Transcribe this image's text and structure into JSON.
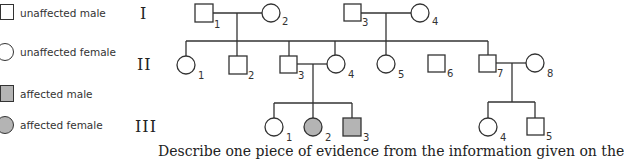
{
  "legend": {
    "items": [
      {
        "label": "unaffected male",
        "shape": "square",
        "affected": false
      },
      {
        "label": "unaffected female",
        "shape": "circle",
        "affected": false
      },
      {
        "label": "affected male",
        "shape": "square",
        "affected": true
      },
      {
        "label": "affected female",
        "shape": "circle",
        "affected": true
      }
    ]
  },
  "generations": [
    "I",
    "II",
    "III"
  ],
  "individuals": {
    "I": [
      {
        "id": "1",
        "sex": "male",
        "affected": false
      },
      {
        "id": "2",
        "sex": "female",
        "affected": false
      },
      {
        "id": "3",
        "sex": "male",
        "affected": false
      },
      {
        "id": "4",
        "sex": "female",
        "affected": false
      }
    ],
    "II": [
      {
        "id": "1",
        "sex": "female",
        "affected": false
      },
      {
        "id": "2",
        "sex": "male",
        "affected": false
      },
      {
        "id": "3",
        "sex": "male",
        "affected": false
      },
      {
        "id": "4",
        "sex": "female",
        "affected": false
      },
      {
        "id": "5",
        "sex": "female",
        "affected": false
      },
      {
        "id": "6",
        "sex": "male",
        "affected": false
      },
      {
        "id": "7",
        "sex": "male",
        "affected": false
      },
      {
        "id": "8",
        "sex": "female",
        "affected": false
      }
    ],
    "III": [
      {
        "id": "1",
        "sex": "female",
        "affected": false
      },
      {
        "id": "2",
        "sex": "female",
        "affected": true
      },
      {
        "id": "3",
        "sex": "male",
        "affected": true
      },
      {
        "id": "4",
        "sex": "female",
        "affected": false
      },
      {
        "id": "5",
        "sex": "male",
        "affected": false
      }
    ]
  },
  "colors": {
    "line": "#333333",
    "affected_fill": "#b4b4b4",
    "unaffected_fill": "#ffffff"
  },
  "caption": "Describe one piece of evidence from the information given on the"
}
